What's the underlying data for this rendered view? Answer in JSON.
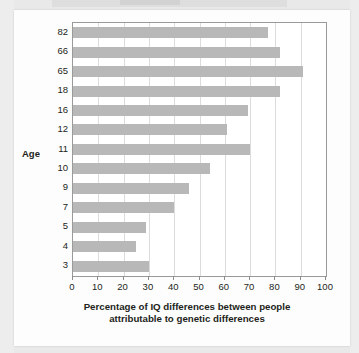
{
  "chart_data": {
    "type": "bar",
    "orientation": "horizontal",
    "title": "",
    "xlabel": "Percentage of IQ differences between people attributable to genetic differences",
    "xlabel_lines": [
      "Percentage of IQ differences between people",
      "attributable to genetic differences"
    ],
    "ylabel": "Age",
    "categories": [
      "82",
      "66",
      "65",
      "18",
      "16",
      "12",
      "11",
      "10",
      "9",
      "7",
      "5",
      "4",
      "3"
    ],
    "values": [
      77,
      82,
      91,
      82,
      69,
      61,
      70,
      54,
      46,
      40,
      29,
      25,
      30
    ],
    "xlim": [
      0,
      100
    ],
    "xticks": [
      0,
      10,
      20,
      30,
      40,
      50,
      60,
      70,
      80,
      90,
      100
    ],
    "xticklabels": [
      "0",
      "10",
      "20",
      "30",
      "40",
      "50",
      "60",
      "70",
      "80",
      "90",
      "100"
    ],
    "grid": "vertical",
    "legend": "none",
    "bar_color": "#b8b8b8",
    "frame_color": "#9a9a9a",
    "gridline_color": "#dcdcdc",
    "text_color": "#231f20",
    "background": "#ffffff",
    "page_background": "#e9e9e9"
  }
}
